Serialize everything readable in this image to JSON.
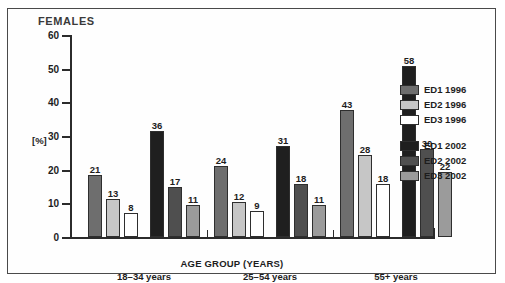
{
  "chart_data": {
    "type": "bar",
    "title": "FEMALES",
    "xlabel": "AGE GROUP (YEARS)",
    "ylabel": "[%]",
    "ylim": [
      0,
      60
    ],
    "yticks": [
      0,
      10,
      20,
      30,
      40,
      50,
      60
    ],
    "grid": false,
    "legend_position": "right",
    "categories": [
      "18–34 years",
      "25–54 years",
      "55+ years"
    ],
    "series": [
      {
        "name": "ED1 1996",
        "color": "#6e6e6e",
        "values": [
          21,
          24,
          43
        ]
      },
      {
        "name": "ED2 1996",
        "color": "#c6c6c6",
        "values": [
          13,
          12,
          28
        ]
      },
      {
        "name": "ED3 1996",
        "color": "#ffffff",
        "values": [
          8,
          9,
          18
        ]
      },
      {
        "name": "ED1 2002",
        "color": "#1f1f1f",
        "values": [
          36,
          31,
          58
        ]
      },
      {
        "name": "ED2 2002",
        "color": "#4f4f4f",
        "values": [
          17,
          18,
          30
        ]
      },
      {
        "name": "ED3 2002",
        "color": "#9b9b9b",
        "values": [
          11,
          11,
          22
        ]
      }
    ]
  },
  "legend": {
    "entries": [
      {
        "label": "ED1 1996",
        "color": "#6e6e6e"
      },
      {
        "label": "ED2 1996",
        "color": "#c6c6c6"
      },
      {
        "label": "ED3 1996",
        "color": "#ffffff"
      },
      {
        "label": "ED1 2002",
        "color": "#1f1f1f"
      },
      {
        "label": "ED2 2002",
        "color": "#4f4f4f"
      },
      {
        "label": "ED3 2002",
        "color": "#9b9b9b"
      }
    ]
  }
}
